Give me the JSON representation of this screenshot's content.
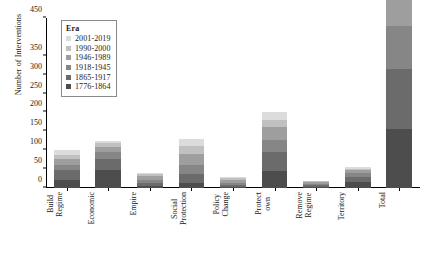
{
  "chart_data": {
    "type": "bar",
    "title": "",
    "xlabel": "",
    "ylabel": "Number of Interventions",
    "ylim": [
      0,
      450
    ],
    "yticks": [
      0,
      50,
      100,
      150,
      200,
      250,
      300,
      350,
      450
    ],
    "ytick_labels": [
      "0",
      "50",
      "100",
      "150",
      "200",
      "250",
      "300",
      "350",
      "450"
    ],
    "grid": false,
    "stacked": true,
    "legend": {
      "title": "Era",
      "position": "upper-left-inside"
    },
    "categories": [
      "Build Regime",
      "Economic",
      "Empire",
      "Social Protection",
      "Policy Change",
      "Protect own",
      "Remove Regime",
      "Territory",
      "Total"
    ],
    "series": [
      {
        "name": "1776-1864",
        "color": "#4d4d4d",
        "values": [
          22,
          47,
          5,
          14,
          3,
          46,
          3,
          16,
          156
        ]
      },
      {
        "name": "1865-1917",
        "color": "#6b6b6b",
        "values": [
          26,
          31,
          7,
          24,
          5,
          49,
          4,
          14,
          160
        ]
      },
      {
        "name": "1918-1945",
        "color": "#868686",
        "values": [
          13,
          17,
          9,
          22,
          6,
          33,
          4,
          10,
          114
        ]
      },
      {
        "name": "1946-1989",
        "color": "#9e9e9e",
        "values": [
          16,
          14,
          10,
          30,
          7,
          34,
          5,
          7,
          123
        ]
      },
      {
        "name": "1990-2000",
        "color": "#c0c0c0",
        "values": [
          11,
          9,
          5,
          20,
          5,
          19,
          2,
          4,
          75
        ]
      },
      {
        "name": "2001-2019",
        "color": "#dcdcdc",
        "values": [
          12,
          7,
          4,
          20,
          4,
          19,
          2,
          4,
          72
        ]
      }
    ],
    "totals": [
      100,
      125,
      40,
      130,
      30,
      200,
      20,
      55,
      445
    ]
  }
}
